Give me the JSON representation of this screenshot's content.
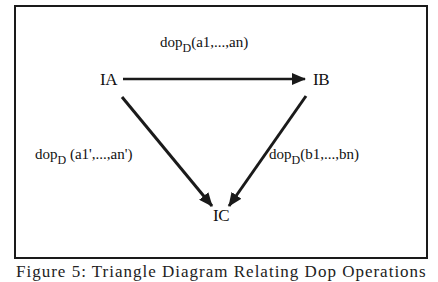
{
  "diagram": {
    "nodes": {
      "a": {
        "label": "IA"
      },
      "b": {
        "label": "IB"
      },
      "c": {
        "label": "IC"
      }
    },
    "edges": [
      {
        "from": "IA",
        "to": "IB",
        "op": "dop",
        "sub": "D",
        "args": "(a1,...,an)"
      },
      {
        "from": "IA",
        "to": "IC",
        "op": "dop",
        "sub": "D",
        "args": " (a1',...,an')"
      },
      {
        "from": "IB",
        "to": "IC",
        "op": "dop",
        "sub": "D",
        "args": "(b1,...,bn)"
      }
    ],
    "caption": "Figure 5: Triangle Diagram Relating Dop Operations"
  },
  "colors": {
    "stroke": "#1a1a1a",
    "background": "#ffffff"
  }
}
